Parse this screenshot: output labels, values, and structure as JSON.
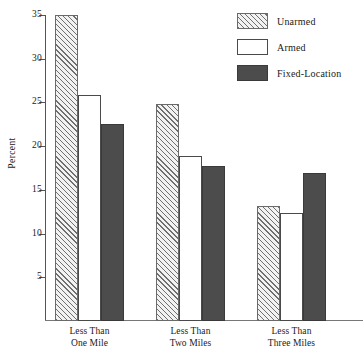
{
  "chart_data": {
    "type": "bar",
    "title": "",
    "xlabel": "",
    "ylabel": "Percent",
    "ylim": [
      0,
      35
    ],
    "yticks": [
      5,
      10,
      15,
      20,
      25,
      30,
      35
    ],
    "ytick_labels": [
      "5",
      "10",
      "15",
      "20",
      "25",
      "30",
      "35"
    ],
    "grid": false,
    "legend_position": "top-right",
    "categories": [
      "Less Than One Mile",
      "Less Than Two Miles",
      "Less Than Three Miles"
    ],
    "category_lines": [
      [
        "Less Than",
        "One Mile"
      ],
      [
        "Less Than",
        "Two Miles"
      ],
      [
        "Less Than",
        "Three Miles"
      ]
    ],
    "series": [
      {
        "name": "Unarmed",
        "fill": "diagonal-hatch",
        "color": "#6f6f6f",
        "values": [
          35.0,
          24.8,
          13.2
        ]
      },
      {
        "name": "Armed",
        "fill": "empty",
        "color": "#ffffff",
        "values": [
          25.8,
          18.9,
          12.4
        ]
      },
      {
        "name": "Fixed-Location",
        "fill": "solid",
        "color": "#4c4c4c",
        "values": [
          22.5,
          17.7,
          16.9
        ]
      }
    ]
  },
  "legend": {
    "items": [
      {
        "label": "Unarmed",
        "swatch": "hatched-swatch"
      },
      {
        "label": "Armed",
        "swatch": "outline-swatch"
      },
      {
        "label": "Fixed-Location",
        "swatch": "solid-swatch"
      }
    ]
  },
  "axes": {
    "y_title": "Percent"
  }
}
